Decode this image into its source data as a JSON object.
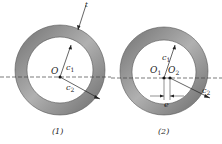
{
  "figure1": {
    "center_label": "O",
    "inner_radius_label": "c",
    "inner_sub": "1",
    "outer_radius_label": "c",
    "outer_sub": "2",
    "thickness_label": "t",
    "caption": "(1)"
  },
  "figure2": {
    "center1_label": "O",
    "center1_sub": "1",
    "center2_label": "O",
    "center2_sub": "2",
    "inner_radius_label": "c",
    "inner_sub": "1",
    "outer_radius_label": "c",
    "outer_sub": "2",
    "eccentricity_label": "e",
    "caption": "(2)"
  },
  "colors": {
    "ring": "#8a8a8a",
    "ring_dark": "#6a6a6a",
    "line": "#333333"
  }
}
